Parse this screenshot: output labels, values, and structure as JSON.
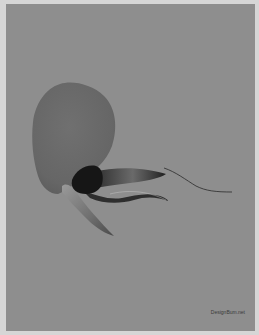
{
  "artwork": {
    "description": "Abstract grayscale organic form resembling a flower/petal with trailing tendrils on a gray background",
    "colors": {
      "frame": "#d6d6d6",
      "background": "#8e8e8e",
      "petal": "#6a6a6a",
      "core": "#1a1a1a",
      "lower_blade": "#777777",
      "tendril": "#2a2a2a"
    }
  },
  "watermark": {
    "text": "DesignBum.net"
  }
}
